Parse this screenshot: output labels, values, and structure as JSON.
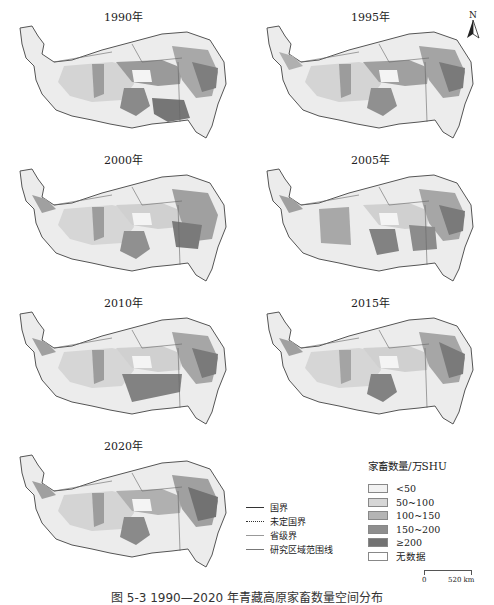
{
  "figure": {
    "caption": "图 5-3  1990—2020 年青藏高原家畜数量空间分布",
    "panels": [
      {
        "year_label": "1990年"
      },
      {
        "year_label": "1995年"
      },
      {
        "year_label": "2000年"
      },
      {
        "year_label": "2005年"
      },
      {
        "year_label": "2010年"
      },
      {
        "year_label": "2015年"
      },
      {
        "year_label": "2020年"
      }
    ],
    "north_arrow": {
      "label": "N"
    }
  },
  "legend": {
    "lines": [
      {
        "label": "国界",
        "style": "solid"
      },
      {
        "label": "未定国界",
        "style": "dotted"
      },
      {
        "label": "省级界",
        "style": "thin"
      },
      {
        "label": "研究区域范围线",
        "style": "study"
      }
    ],
    "title": "家畜数量/万SHU",
    "classes": [
      {
        "label": "<50",
        "color": "#f2f2f2"
      },
      {
        "label": "50~100",
        "color": "#d6d6d6"
      },
      {
        "label": "100~150",
        "color": "#b4b4b4"
      },
      {
        "label": "150~200",
        "color": "#8e8e8e"
      },
      {
        "label": "≥200",
        "color": "#727272"
      },
      {
        "label": "无数据",
        "color": "#ffffff"
      }
    ]
  },
  "scalebar": {
    "start": "0",
    "end": "520 km"
  }
}
